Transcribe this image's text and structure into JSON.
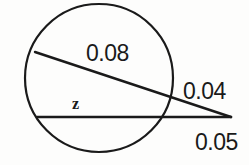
{
  "figure": {
    "background_color": "#fdfdfc",
    "stroke_color": "#1a1a1a",
    "circle": {
      "center_x": 99,
      "center_y": 78,
      "radius": 74,
      "stroke_width": 2.2
    },
    "external_point": {
      "x": 231,
      "y": 117
    },
    "upper_secant": {
      "name": "upper-secant-line",
      "x1": 35,
      "y1": 52,
      "x2": 231,
      "y2": 117,
      "stroke_width": 2.4
    },
    "lower_secant": {
      "name": "lower-secant-line",
      "x1": 37,
      "y1": 117,
      "x2": 231,
      "y2": 117,
      "stroke_width": 2.6
    },
    "labels": {
      "chord": "0.08",
      "external_segment": "0.04",
      "tangent_segment": "0.05",
      "unknown": "z"
    }
  }
}
